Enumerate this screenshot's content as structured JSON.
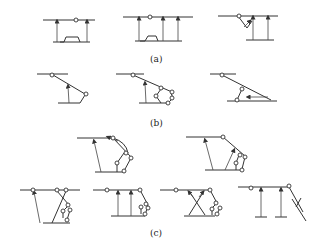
{
  "figure": {
    "labels": {
      "a": "(a)",
      "b": "(b)",
      "c": "(c)"
    },
    "groups": [
      {
        "id": "a",
        "label": "(a)",
        "diagram_count": 3,
        "description": "Parallel-support linkages with vertical arrows between upper bar and base"
      },
      {
        "id": "b",
        "label": "(b)",
        "diagram_count": 3,
        "description": "Inclined-bar linkages with pivots and arrows"
      },
      {
        "id": "c",
        "label": "(c)",
        "diagram_count": 6,
        "description": "Multi-link mechanisms with crossed members and pin joints"
      }
    ],
    "colors": {
      "line": "#333333",
      "background": "#ffffff"
    }
  }
}
